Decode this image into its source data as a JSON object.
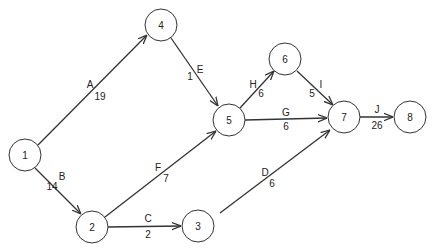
{
  "diagram": {
    "type": "activity-on-arrow network",
    "nodes": [
      {
        "id": "1",
        "label": "1",
        "x": 25,
        "y": 155
      },
      {
        "id": "2",
        "label": "2",
        "x": 92,
        "y": 227
      },
      {
        "id": "3",
        "label": "3",
        "x": 198,
        "y": 226
      },
      {
        "id": "4",
        "label": "4",
        "x": 161,
        "y": 25
      },
      {
        "id": "5",
        "label": "5",
        "x": 229,
        "y": 120
      },
      {
        "id": "6",
        "label": "6",
        "x": 285,
        "y": 59
      },
      {
        "id": "7",
        "label": "7",
        "x": 344,
        "y": 117
      },
      {
        "id": "8",
        "label": "8",
        "x": 410,
        "y": 117
      }
    ],
    "edges": [
      {
        "from": "1",
        "to": "4",
        "activity": "A",
        "duration": "19"
      },
      {
        "from": "1",
        "to": "2",
        "activity": "B",
        "duration": "14"
      },
      {
        "from": "2",
        "to": "3",
        "activity": "C",
        "duration": "2"
      },
      {
        "from": "3",
        "to": "7",
        "activity": "D",
        "duration": "6"
      },
      {
        "from": "4",
        "to": "5",
        "activity": "E",
        "duration": "1"
      },
      {
        "from": "2",
        "to": "5",
        "activity": "F",
        "duration": "7"
      },
      {
        "from": "5",
        "to": "7",
        "activity": "G",
        "duration": "6"
      },
      {
        "from": "5",
        "to": "6",
        "activity": "H",
        "duration": "6"
      },
      {
        "from": "6",
        "to": "7",
        "activity": "I",
        "duration": "5"
      },
      {
        "from": "7",
        "to": "8",
        "activity": "J",
        "duration": "26"
      }
    ]
  }
}
